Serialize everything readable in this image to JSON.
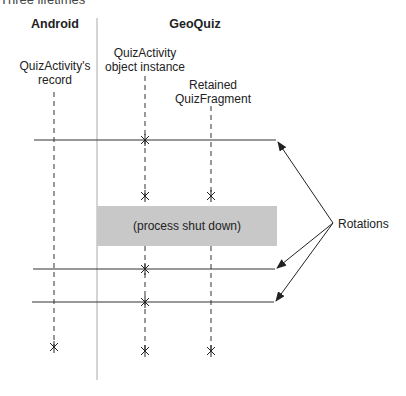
{
  "figure": {
    "caption_fragment": "Three lifetimes",
    "columns": {
      "android": "Android",
      "geoquiz": "GeoQuiz"
    },
    "lifelines": [
      {
        "id": "record",
        "label_line1": "QuizActivity's",
        "label_line2": "record"
      },
      {
        "id": "activity",
        "label_line1": "QuizActivity",
        "label_line2": "object instance"
      },
      {
        "id": "fragment",
        "label_line1": "Retained",
        "label_line2": "QuizFragment"
      }
    ],
    "process_box": "(process shut down)",
    "rotations_label": "Rotations",
    "colors": {
      "line": "#333333",
      "divider": "#aaaaaa",
      "process_box": "#c8c8c8"
    }
  }
}
